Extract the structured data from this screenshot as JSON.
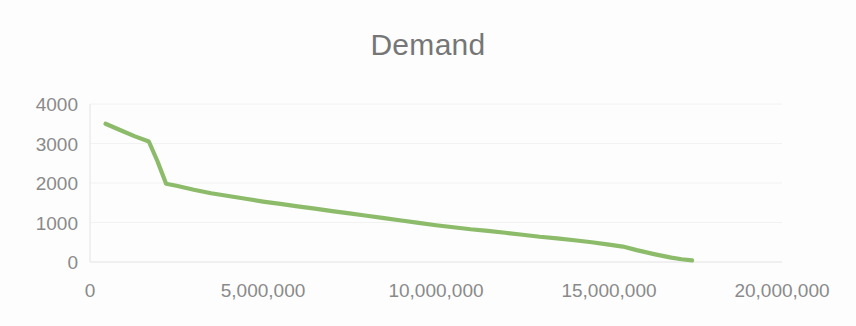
{
  "chart_data": {
    "type": "line",
    "title": "Demand",
    "xlabel": "",
    "ylabel": "",
    "xlim": [
      0,
      20000000
    ],
    "ylim": [
      0,
      4000
    ],
    "x_ticks": [
      0,
      5000000,
      10000000,
      15000000,
      20000000
    ],
    "x_tick_labels": [
      "0",
      "5,000,000",
      "10,000,000",
      "15,000,000",
      "20,000,000"
    ],
    "y_ticks": [
      0,
      1000,
      2000,
      3000,
      4000
    ],
    "y_tick_labels": [
      "0",
      "1000",
      "2000",
      "3000",
      "4000"
    ],
    "grid": true,
    "legend": false,
    "series": [
      {
        "name": "Demand",
        "color": "#8CBB6A",
        "x": [
          450000,
          900000,
          1300000,
          1700000,
          1950000,
          2200000,
          2500000,
          3000000,
          3500000,
          4000000,
          4500000,
          5000000,
          5500000,
          6000000,
          6500000,
          7000000,
          7500000,
          8000000,
          8500000,
          9000000,
          9500000,
          10000000,
          10500000,
          11000000,
          11500000,
          12000000,
          12500000,
          13000000,
          13500000,
          14000000,
          14500000,
          15000000,
          15400000,
          15800000,
          16300000,
          16800000,
          17100000,
          17400000
        ],
        "y": [
          3500,
          3330,
          3180,
          3050,
          2550,
          1980,
          1930,
          1830,
          1740,
          1670,
          1600,
          1530,
          1470,
          1410,
          1350,
          1290,
          1230,
          1170,
          1110,
          1050,
          990,
          930,
          880,
          830,
          790,
          740,
          690,
          640,
          600,
          550,
          500,
          440,
          390,
          300,
          200,
          110,
          70,
          40
        ]
      }
    ]
  }
}
